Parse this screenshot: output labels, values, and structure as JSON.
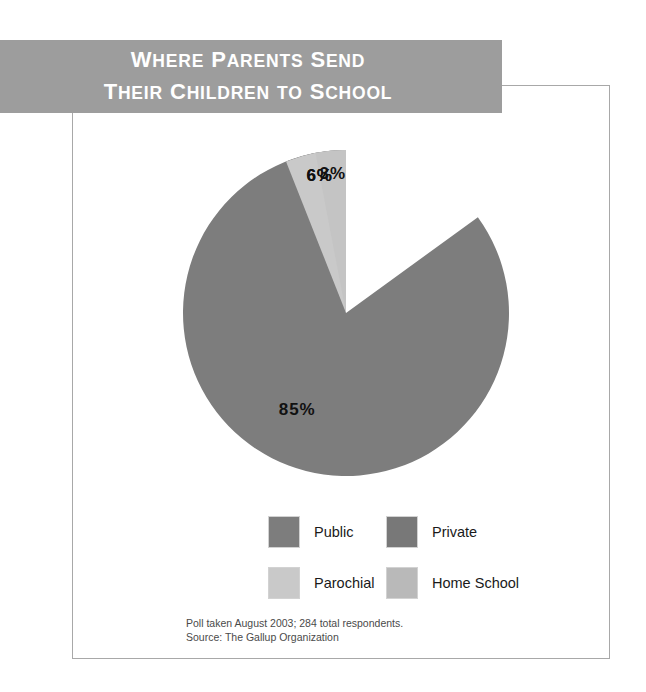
{
  "banner": {
    "line1": "Where Parents Send",
    "line2": "Their Children to School",
    "line1_words": [
      "Where",
      "Parents",
      "Send"
    ],
    "line2_words": [
      "Their",
      "Children",
      "to",
      "School"
    ],
    "background_color": "#9d9d9d",
    "text_color": "#ffffff"
  },
  "chart_data": {
    "type": "pie",
    "categories": [
      "Public",
      "Private",
      "Parochial",
      "Home School"
    ],
    "values": [
      85,
      6,
      6,
      3
    ],
    "value_labels": [
      "85%",
      "6%",
      "6%",
      "3%"
    ],
    "colors": [
      "#7d7d7d",
      "#787878",
      "#c9c9c9",
      "#c4c4c4"
    ],
    "legend_position": "bottom",
    "start_angle_deg": 0,
    "direction": "counterclockwise",
    "units": "percent",
    "slices": [
      {
        "label": "Public",
        "value": 85,
        "value_label": "85%",
        "color": "#7d7d7d"
      },
      {
        "label": "Private",
        "value": 6,
        "value_label": "6%",
        "color": "#787878"
      },
      {
        "label": "Parochial",
        "value": 6,
        "value_label": "6%",
        "color": "#c9c9c9"
      },
      {
        "label": "Home School",
        "value": 3,
        "value_label": "3%",
        "color": "#c4c4c4"
      }
    ]
  },
  "legend": {
    "rows": [
      [
        {
          "label": "Public",
          "color": "#7d7d7d"
        },
        {
          "label": "Private",
          "color": "#787878"
        }
      ],
      [
        {
          "label": "Parochial",
          "color": "#c9c9c9"
        },
        {
          "label": "Home School",
          "color": "#b9b9b9"
        }
      ]
    ]
  },
  "footnote": {
    "line1": "Poll taken August 2003; 284 total respondents.",
    "line2": "Source: The Gallup Organization"
  }
}
